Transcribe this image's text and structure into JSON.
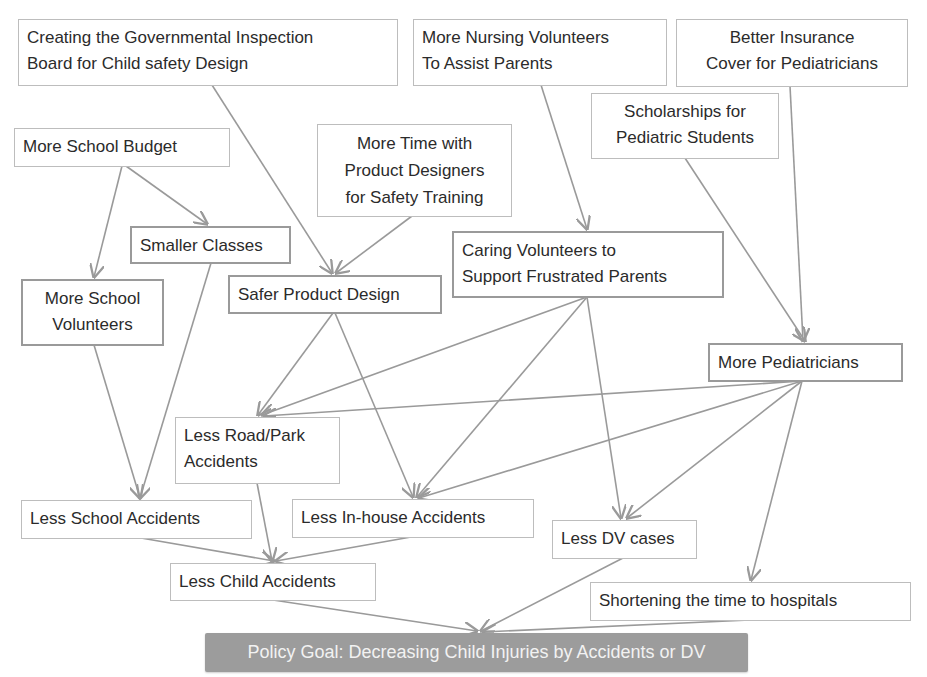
{
  "diagram": {
    "type": "policy causal map",
    "colors": {
      "edge": "#9a9a9a",
      "node_border": "#bdbdbd",
      "goal_fill": "#9c9c9c",
      "goal_text": "#f2f2f2"
    },
    "nodes": {
      "gov_inspection": "Creating the Governmental Inspection\n Board for Child safety Design",
      "nursing_volunteers": "More Nursing Volunteers\nTo Assist Parents",
      "better_insurance": "Better Insurance\nCover for Pediatricians",
      "scholarships": "Scholarships for\nPediatric Students",
      "school_budget": "More School Budget",
      "time_designers": "More Time with\nProduct Designers\nfor Safety Training",
      "smaller_classes": "Smaller Classes",
      "caring_volunteers": "Caring Volunteers to\nSupport Frustrated Parents",
      "school_volunteers": "More School\nVolunteers",
      "safer_design": "Safer Product Design",
      "more_pediatricians": "More Pediatricians",
      "road_park": "Less Road/Park\nAccidents",
      "school_accidents": "Less School Accidents",
      "inhouse_accidents": "Less In-house Accidents",
      "dv_cases": "Less DV cases",
      "child_accidents": "Less Child Accidents",
      "shortening": "Shortening the time to hospitals",
      "goal": "Policy Goal: Decreasing Child Injuries by Accidents or DV"
    },
    "edges": [
      [
        "school_budget",
        "school_volunteers"
      ],
      [
        "school_budget",
        "smaller_classes"
      ],
      [
        "gov_inspection",
        "safer_design"
      ],
      [
        "time_designers",
        "safer_design"
      ],
      [
        "nursing_volunteers",
        "caring_volunteers"
      ],
      [
        "scholarships",
        "more_pediatricians"
      ],
      [
        "better_insurance",
        "more_pediatricians"
      ],
      [
        "school_volunteers",
        "school_accidents"
      ],
      [
        "smaller_classes",
        "school_accidents"
      ],
      [
        "safer_design",
        "road_park"
      ],
      [
        "safer_design",
        "inhouse_accidents"
      ],
      [
        "caring_volunteers",
        "road_park"
      ],
      [
        "caring_volunteers",
        "inhouse_accidents"
      ],
      [
        "caring_volunteers",
        "dv_cases"
      ],
      [
        "more_pediatricians",
        "road_park"
      ],
      [
        "more_pediatricians",
        "inhouse_accidents"
      ],
      [
        "more_pediatricians",
        "dv_cases"
      ],
      [
        "more_pediatricians",
        "shortening"
      ],
      [
        "school_accidents",
        "child_accidents"
      ],
      [
        "road_park",
        "child_accidents"
      ],
      [
        "inhouse_accidents",
        "child_accidents"
      ],
      [
        "child_accidents",
        "goal"
      ],
      [
        "dv_cases",
        "goal"
      ],
      [
        "shortening",
        "goal"
      ]
    ]
  }
}
